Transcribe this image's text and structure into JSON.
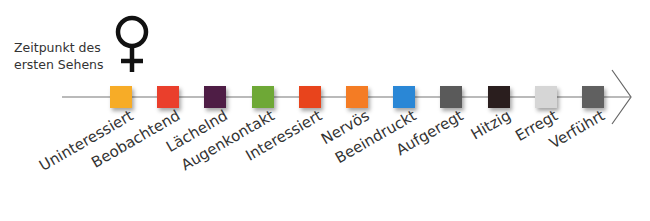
{
  "caption": {
    "line1": "Zeitpunkt des",
    "line2": "ersten Sehens"
  },
  "symbol": "female-symbol",
  "stages": [
    {
      "label": "Uninteressiert",
      "color": "#f7ac27"
    },
    {
      "label": "Beobachtend",
      "color": "#ea3f2c"
    },
    {
      "label": "Lächelnd",
      "color": "#4e1d45"
    },
    {
      "label": "Augenkontakt",
      "color": "#6ea836"
    },
    {
      "label": "Interessiert",
      "color": "#e8441c"
    },
    {
      "label": "Nervös",
      "color": "#f47c24"
    },
    {
      "label": "Beeindruckt",
      "color": "#2a87d6"
    },
    {
      "label": "Aufgeregt",
      "color": "#5a5a5a"
    },
    {
      "label": "Hitzig",
      "color": "#2a1e1e"
    },
    {
      "label": "Erregt",
      "color": "#d6d6d6"
    },
    {
      "label": "Verführt",
      "color": "#606060"
    }
  ]
}
